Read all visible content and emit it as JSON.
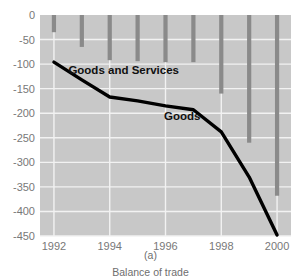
{
  "chart_data": {
    "type": "bar",
    "title": "",
    "subtitle": "",
    "xlabel": "",
    "ylabel": "",
    "grid": true,
    "legend_position": "inline-annotations",
    "x": [
      1992,
      1993,
      1994,
      1995,
      1996,
      1997,
      1998,
      1999,
      2000
    ],
    "categories": [
      "1992",
      "1993",
      "1994",
      "1995",
      "1996",
      "1997",
      "1998",
      "1999",
      "2000"
    ],
    "xlim": [
      1991.5,
      2000.5
    ],
    "ylim": [
      -450,
      0
    ],
    "xticks": [
      1992,
      1994,
      1996,
      1998,
      2000
    ],
    "xtick_labels": [
      "1992",
      "1994",
      "1996",
      "1998",
      "2000"
    ],
    "yticks": [
      0,
      -50,
      -100,
      -150,
      -200,
      -250,
      -300,
      -350,
      -400,
      -450
    ],
    "ytick_labels": [
      "0",
      "-50",
      "-100",
      "-150",
      "-200",
      "-250",
      "-300",
      "-350",
      "-400",
      "-450"
    ],
    "series": [
      {
        "name": "Goods and Services",
        "type": "bar",
        "color": "#8a8a8a",
        "values": [
          -35,
          -65,
          -92,
          -94,
          -96,
          -96,
          -160,
          -260,
          -368
        ]
      },
      {
        "name": "Goods",
        "type": "line",
        "color": "#000000",
        "values": [
          -96,
          -132,
          -167,
          -175,
          -185,
          -193,
          -238,
          -330,
          -448
        ]
      }
    ],
    "annotations": [
      {
        "text": "Goods and Services",
        "x": 1994.5,
        "y": -120
      },
      {
        "text": "Goods",
        "x": 1996.6,
        "y": -213
      }
    ]
  },
  "caption": {
    "panel_label": "(a)",
    "title": "Balance of trade"
  },
  "colors": {
    "plot_background": "#c8c8c8",
    "gridline": "#f2f2f2",
    "bar": "#8a8a8a",
    "line": "#000000",
    "axis_text": "#787878",
    "caption_text": "#6e6e6e",
    "annotation_text": "#101010",
    "page_background": "#ffffff"
  }
}
